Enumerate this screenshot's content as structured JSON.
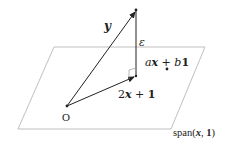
{
  "diagram": {
    "colors": {
      "plane": "#b8b8b8",
      "vector": "#222222",
      "text": "#222222",
      "background": "#ffffff"
    },
    "plane": {
      "label_main": "span(",
      "label_x": "x",
      "label_sep": ", ",
      "label_one": "1",
      "label_close": ")"
    },
    "origin": {
      "label": "O"
    },
    "vectors": {
      "y": {
        "label": "y"
      },
      "projection": {
        "label_coef": "2",
        "label_x": "x",
        "label_op": " + ",
        "label_one": "1"
      },
      "residual": {
        "label": "ε"
      }
    },
    "point": {
      "label_a": "a",
      "label_x": "x",
      "label_op": " + ",
      "label_b": "b",
      "label_one": "1"
    }
  }
}
